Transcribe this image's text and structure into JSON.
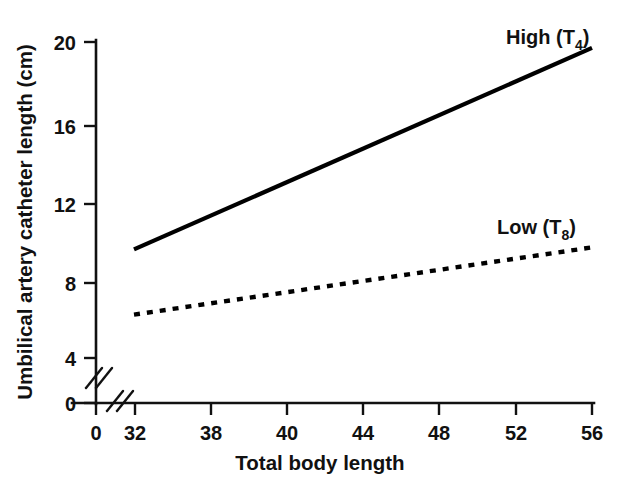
{
  "chart_data": {
    "type": "line",
    "title": "",
    "xlabel": "Total body length",
    "ylabel": "Umbilical artery catheter length (cm)",
    "xlim": [
      32,
      56
    ],
    "ylim": [
      0,
      20
    ],
    "grid": false,
    "legend_position": "inline-right",
    "axis_breaks": {
      "x": "between 0 and 32",
      "y": "between 0 and 4"
    },
    "x_ticks": [
      {
        "label": "0",
        "value": 0
      },
      {
        "label": "32",
        "value": 32
      },
      {
        "label": "38",
        "value": 36
      },
      {
        "label": "40",
        "value": 40
      },
      {
        "label": "44",
        "value": 44
      },
      {
        "label": "48",
        "value": 48
      },
      {
        "label": "52",
        "value": 52
      },
      {
        "label": "56",
        "value": 56
      }
    ],
    "y_ticks": [
      {
        "label": "0",
        "value": 0
      },
      {
        "label": "4",
        "value": 4
      },
      {
        "label": "8",
        "value": 8
      },
      {
        "label": "12",
        "value": 12
      },
      {
        "label": "16",
        "value": 16
      },
      {
        "label": "20",
        "value": 20
      }
    ],
    "series": [
      {
        "name": "High (T4)",
        "label_text": "High (T",
        "label_sub": "4",
        "label_close": ")",
        "style": "solid",
        "color": "#000000",
        "x": [
          32,
          56
        ],
        "values": [
          9.5,
          19.7
        ]
      },
      {
        "name": "Low (T8)",
        "label_text": "Low (T",
        "label_sub": "8",
        "label_close": ")",
        "style": "dotted",
        "color": "#000000",
        "x": [
          32,
          56
        ],
        "values": [
          6.2,
          9.6
        ]
      }
    ]
  },
  "colors": {
    "ink": "#111111",
    "background": "#ffffff"
  }
}
